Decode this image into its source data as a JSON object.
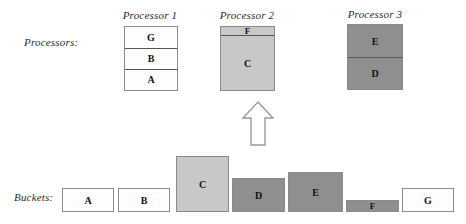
{
  "labels": {
    "processors_row": "Processors:",
    "buckets_row": "Buckets:"
  },
  "colors": {
    "white": "#fdfdfd",
    "light_gray": "#c8c8c8",
    "dark_gray": "#8f8f8f",
    "border": "#8a8a8a",
    "divider": "#555555",
    "text": "#111111",
    "arrow_stroke": "#9a9a9a"
  },
  "processors": [
    {
      "title": "Processor 1",
      "segments": [
        {
          "label": "G",
          "fill": "white"
        },
        {
          "label": "B",
          "fill": "white"
        },
        {
          "label": "A",
          "fill": "white"
        }
      ]
    },
    {
      "title": "Processor 2",
      "segments": [
        {
          "label": "F",
          "fill": "light_gray"
        },
        {
          "label": "C",
          "fill": "light_gray"
        }
      ]
    },
    {
      "title": "Processor 3",
      "segments": [
        {
          "label": "E",
          "fill": "dark_gray"
        },
        {
          "label": "D",
          "fill": "dark_gray"
        }
      ]
    }
  ],
  "buckets": [
    {
      "label": "A",
      "fill": "white"
    },
    {
      "label": "B",
      "fill": "white"
    },
    {
      "label": "C",
      "fill": "light_gray"
    },
    {
      "label": "D",
      "fill": "dark_gray"
    },
    {
      "label": "E",
      "fill": "dark_gray"
    },
    {
      "label": "F",
      "fill": "dark_gray"
    },
    {
      "label": "G",
      "fill": "white"
    }
  ],
  "arrow": {
    "direction": "up"
  }
}
